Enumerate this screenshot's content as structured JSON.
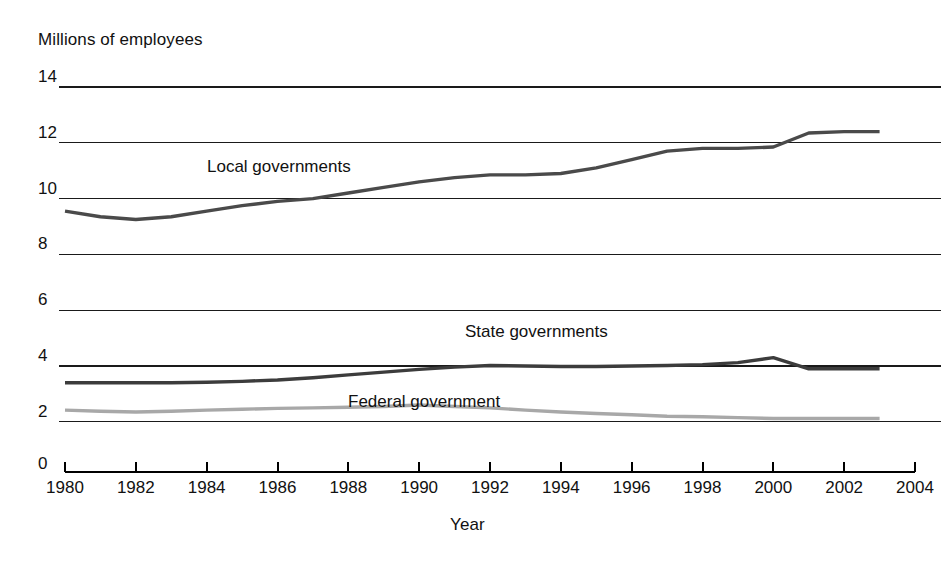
{
  "chart_data": {
    "type": "line",
    "title": "",
    "ylabel": "Millions of employees",
    "xlabel": "Year",
    "ylim": [
      0,
      14
    ],
    "xlim": [
      1980,
      2004
    ],
    "grid": true,
    "legend_position": "inline-labels",
    "y_ticks": [
      14,
      12,
      10,
      8,
      6,
      4,
      2,
      0
    ],
    "y_tick_labels": [
      "14",
      "12",
      "10",
      "8",
      "6",
      "4",
      "2",
      "0"
    ],
    "x_ticks": [
      1980,
      1982,
      1984,
      1986,
      1988,
      1990,
      1992,
      1994,
      1996,
      1998,
      2000,
      2002,
      2004
    ],
    "x_tick_labels": [
      "1980",
      "1982",
      "1984",
      "1986",
      "1988",
      "1990",
      "1992",
      "1994",
      "1996",
      "1998",
      "2000",
      "2002",
      "2004"
    ],
    "x": [
      1980,
      1981,
      1982,
      1983,
      1984,
      1985,
      1986,
      1987,
      1988,
      1989,
      1990,
      1991,
      1992,
      1993,
      1994,
      1995,
      1996,
      1997,
      1998,
      1999,
      2000,
      2001,
      2002,
      2003
    ],
    "series": [
      {
        "name": "Local governments",
        "color": "#4a4a4a",
        "width": 3.4,
        "label_x": 1985.4,
        "label_y": 10.75,
        "values": [
          9.55,
          9.35,
          9.25,
          9.35,
          9.55,
          9.75,
          9.9,
          10.0,
          10.2,
          10.4,
          10.6,
          10.75,
          10.85,
          10.85,
          10.9,
          11.1,
          11.4,
          11.7,
          11.8,
          11.8,
          11.85,
          12.35,
          12.4,
          12.4
        ]
      },
      {
        "name": "State governments",
        "color": "#3c3c3c",
        "width": 3.4,
        "label_x": 1992.3,
        "label_y": 4.85,
        "values": [
          3.4,
          3.4,
          3.4,
          3.4,
          3.42,
          3.45,
          3.5,
          3.58,
          3.68,
          3.78,
          3.88,
          3.96,
          4.02,
          4.0,
          3.98,
          3.98,
          4.0,
          4.02,
          4.05,
          4.12,
          4.3,
          3.9,
          3.9,
          3.9
        ]
      },
      {
        "name": "Federal government",
        "color": "#a8a8a8",
        "width": 3.4,
        "label_x": 1989.6,
        "label_y": 2.55,
        "values": [
          2.42,
          2.38,
          2.35,
          2.38,
          2.42,
          2.45,
          2.48,
          2.5,
          2.52,
          2.55,
          2.6,
          2.55,
          2.5,
          2.42,
          2.35,
          2.3,
          2.25,
          2.2,
          2.18,
          2.15,
          2.12,
          2.12,
          2.12,
          2.12
        ]
      }
    ]
  },
  "layout": {
    "plot_left": 65,
    "plot_right": 915,
    "plot_top": 87,
    "plot_bottom": 472,
    "grid_top_value": 14,
    "grid_bottom_value": 2,
    "grid_top_y": 87,
    "grid_step_y": 55.8,
    "axis_y": 472,
    "tick_len": 10
  }
}
